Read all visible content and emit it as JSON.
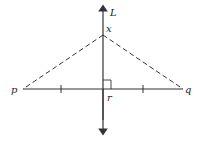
{
  "diagram": {
    "type": "geometry",
    "labels": {
      "line": "L",
      "apex": "x",
      "midpoint": "r",
      "left_endpoint": "p",
      "right_endpoint": "q"
    },
    "colors": {
      "stroke": "#333333",
      "background": "#ffffff"
    }
  }
}
